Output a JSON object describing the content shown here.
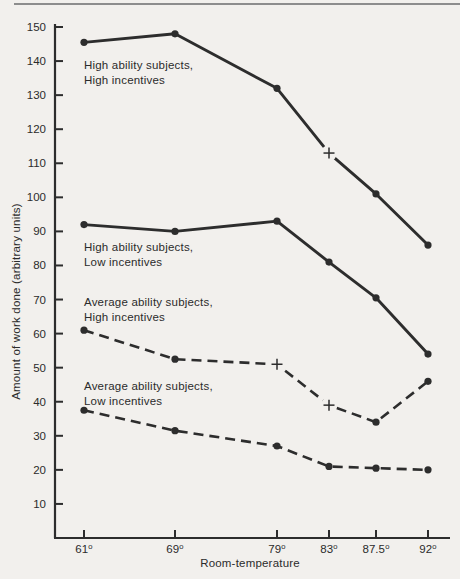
{
  "page": {
    "background_color": "#f2f0ed",
    "top_rule_color": "#8d8d8d",
    "ink_color": "#2d2d2d",
    "text_color": "#2b2b2b"
  },
  "chart_data": {
    "type": "line",
    "title": "",
    "xlabel": "Room-temperature",
    "ylabel": "Amount of work done (arbitrary units)",
    "x_categories": [
      "61⁰",
      "69⁰",
      "79⁰",
      "83⁰",
      "87.5⁰",
      "92⁰"
    ],
    "x_values": [
      61,
      69,
      79,
      83,
      87.5,
      92
    ],
    "y_ticks": [
      10,
      20,
      30,
      40,
      50,
      60,
      70,
      80,
      90,
      100,
      110,
      120,
      130,
      140,
      150
    ],
    "ylim": [
      0,
      151
    ],
    "grid": false,
    "legend_position": "inline-labels",
    "series": [
      {
        "name": "high-ability-high-incentives",
        "label": [
          "High ability subjects,",
          "High incentives"
        ],
        "style": "solid",
        "values": [
          145.5,
          148,
          132,
          113,
          101,
          86
        ],
        "markers": [
          "dot",
          "dot",
          "dot",
          "plus",
          "dot",
          "dot"
        ]
      },
      {
        "name": "high-ability-low-incentives",
        "label": [
          "High ability subjects,",
          "Low incentives"
        ],
        "style": "solid",
        "values": [
          92,
          90,
          93,
          81,
          70.5,
          54
        ],
        "markers": [
          "dot",
          "dot",
          "dot",
          "dot",
          "dot",
          "dot"
        ]
      },
      {
        "name": "average-ability-high-incentives",
        "label": [
          "Average ability subjects,",
          "High incentives"
        ],
        "style": "dashed",
        "values": [
          61,
          52.5,
          51,
          39,
          34,
          46
        ],
        "markers": [
          "dot",
          "dot",
          "plus",
          "plus",
          "dot",
          "dot"
        ]
      },
      {
        "name": "average-ability-low-incentives",
        "label": [
          "Average ability subjects,",
          "Low incentives"
        ],
        "style": "dashed",
        "values": [
          37.5,
          31.5,
          27,
          21,
          20.5,
          20
        ],
        "markers": [
          "dot",
          "dot",
          "dot",
          "dot",
          "dot",
          "dot"
        ]
      }
    ]
  }
}
